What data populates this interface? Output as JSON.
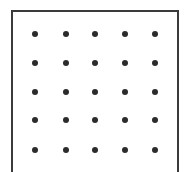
{
  "diagram": {
    "type": "dot-grid",
    "rows": 5,
    "cols": 5,
    "dot_color": "#2b2b2b",
    "border_color": "#3a3a3a",
    "x_positions": [
      35,
      66,
      95,
      125,
      155
    ],
    "y_positions": [
      34,
      63,
      92,
      120,
      150
    ]
  }
}
